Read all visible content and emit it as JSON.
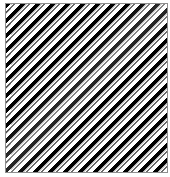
{
  "figure": {
    "width_px": 170,
    "height_px": 177
  },
  "panel": {
    "name": "striped-panel",
    "left_px": 5,
    "top_px": 3,
    "width_px": 163,
    "height_px": 170,
    "background_color": "#ffffff",
    "border_color": "#8e8e8e",
    "border_width_px": 1
  },
  "margin": {
    "side": "left",
    "width_px": 5,
    "color": "#ffffff"
  },
  "pattern": {
    "type": "diagonal-stripes",
    "orientation": "backslash",
    "angle_deg": 135,
    "period_px": 10.6,
    "bands": [
      {
        "role": "thick-dark-bar",
        "color": "#000000",
        "width_px": 3.1
      },
      {
        "role": "gap",
        "color": "#ffffff",
        "width_px": 2.5
      },
      {
        "role": "thin-gray-bar",
        "color": "#6b6b6b",
        "width_px": 1.4
      },
      {
        "role": "gap",
        "color": "#ffffff",
        "width_px": 3.6
      }
    ],
    "approx_stripe_groups_across": 19,
    "colors": {
      "dark": "#000000",
      "mid": "#6b6b6b",
      "light": "#ffffff",
      "frame": "#8e8e8e"
    }
  }
}
